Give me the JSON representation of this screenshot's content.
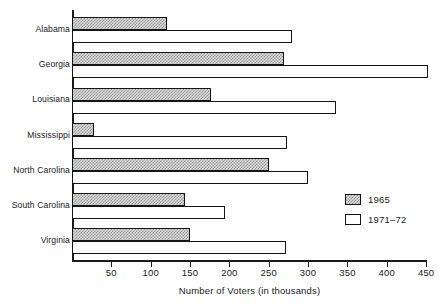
{
  "chart_data": {
    "type": "bar",
    "orientation": "horizontal",
    "title": "",
    "xlabel": "Number of Voters (in thousands)",
    "ylabel": "",
    "xlim": [
      0,
      460
    ],
    "grid": false,
    "legend_position": "inside-bottom-right",
    "xticks": [
      50,
      100,
      150,
      200,
      250,
      300,
      350,
      400,
      450
    ],
    "xtick_labels": [
      "50",
      "100",
      "150",
      "200",
      "250",
      "300",
      "350",
      "400",
      "450"
    ],
    "categories": [
      "Alabama",
      "Georgia",
      "Louisiana",
      "Mississippi",
      "North Carolina",
      "South Carolina",
      "Virginia"
    ],
    "series": [
      {
        "name": "1965",
        "fill": "crosshatch-gray",
        "color": "#d8d8d8",
        "values": [
          121,
          270,
          176,
          28,
          250,
          143,
          150
        ]
      },
      {
        "name": "1971-72",
        "fill": "white",
        "color": "#ffffff",
        "values": [
          280,
          452,
          336,
          273,
          300,
          195,
          272
        ]
      }
    ]
  },
  "legend": {
    "items": [
      {
        "label": "1965"
      },
      {
        "label": "1971–72"
      }
    ]
  },
  "axis": {
    "x_title": "Number of Voters (in thousands)"
  }
}
